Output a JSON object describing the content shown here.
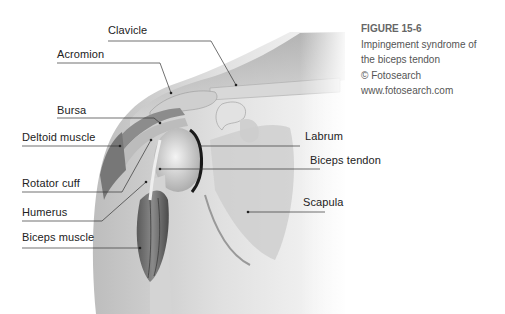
{
  "figure": {
    "number": "FIGURE 15-6",
    "caption_lines": [
      "Impingement syndrome of",
      "the biceps tendon",
      "© Fotosearch",
      "www.fotosearch.com"
    ]
  },
  "labels": {
    "clavicle": "Clavicle",
    "acromion": "Acromion",
    "bursa": "Bursa",
    "deltoid": "Deltoid muscle",
    "rotator_cuff": "Rotator cuff",
    "humerus": "Humerus",
    "biceps_muscle": "Biceps muscle",
    "labrum": "Labrum",
    "biceps_tendon": "Biceps tendon",
    "scapula": "Scapula"
  },
  "colors": {
    "background": "#ffffff",
    "label_text": "#222222",
    "leader_line": "#333333",
    "caption_text": "#555555"
  }
}
